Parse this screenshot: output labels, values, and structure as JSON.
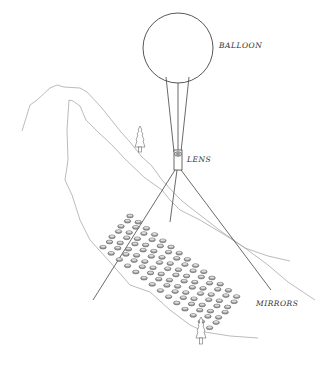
{
  "labels": {
    "balloon": "BALLOON",
    "lens": "LENS",
    "mirrors": "MIRRORS"
  },
  "colors": {
    "line": "#444444",
    "hill": "#aaaaaa",
    "mirror_fill": "#9a9a9a",
    "mirror_stroke": "#555555"
  },
  "components": [
    "balloon",
    "tethers",
    "lens",
    "support-legs",
    "mirror-array",
    "hills",
    "trees"
  ]
}
